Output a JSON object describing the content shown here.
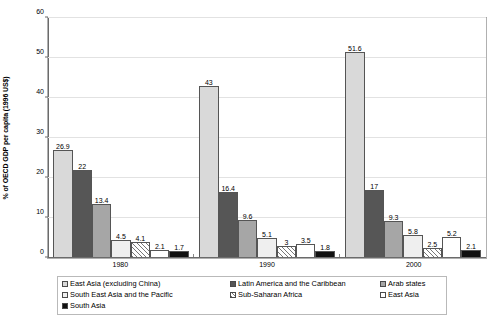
{
  "chart_data": {
    "type": "bar",
    "title": "",
    "xlabel": "",
    "ylabel": "% of OECD GDP per capita (1996 US$)",
    "categories": [
      "1980",
      "1990",
      "2000"
    ],
    "ylim": [
      0,
      60
    ],
    "yticks": [
      0,
      10,
      20,
      30,
      40,
      50,
      60
    ],
    "grid": true,
    "legend_position": "bottom",
    "series": [
      {
        "name": "East Asia (excluding China)",
        "values": [
          26.9,
          43,
          51.6
        ],
        "fill": "lightgray",
        "color": "#d9d9d9"
      },
      {
        "name": "Latin America and the Caribbean",
        "values": [
          22,
          16.4,
          17
        ],
        "fill": "darkgray",
        "color": "#565656"
      },
      {
        "name": "Arab states",
        "values": [
          13.4,
          9.6,
          9.3
        ],
        "fill": "midgray",
        "color": "#a6a6a6"
      },
      {
        "name": "South East Asia and the Pacific",
        "values": [
          4.5,
          5.1,
          5.8
        ],
        "fill": "palegray",
        "color": "#efefef"
      },
      {
        "name": "Sub-Saharan Africa",
        "values": [
          4.1,
          3,
          2.5
        ],
        "fill": "hatch",
        "color": "#ffffff"
      },
      {
        "name": "East Asia",
        "values": [
          2.1,
          3.5,
          5.2
        ],
        "fill": "white",
        "color": "#ffffff"
      },
      {
        "name": "South Asia",
        "values": [
          1.7,
          1.8,
          2.1
        ],
        "fill": "black",
        "color": "#111111"
      }
    ]
  },
  "axis": {
    "y_tick_labels": [
      "0",
      "10",
      "20",
      "30",
      "40",
      "50",
      "60"
    ],
    "x_tick_labels": [
      "1980",
      "1990",
      "2000"
    ],
    "y_axis_title": "% of OECD GDP per capita (1996 US$)"
  },
  "bar_labels": {
    "g0": [
      "26.9",
      "22",
      "13.4",
      "4.5",
      "4.1",
      "2.1",
      "1.7"
    ],
    "g1": [
      "43",
      "16.4",
      "9.6",
      "5.1",
      "3",
      "3.5",
      "1.8"
    ],
    "g2": [
      "51.6",
      "17",
      "9.3",
      "5.8",
      "2.5",
      "5.2",
      "2.1"
    ]
  },
  "legend": {
    "items": [
      {
        "label": "East Asia (excluding China)",
        "fill": "lightgray"
      },
      {
        "label": "Latin America and the Caribbean",
        "fill": "darkgray"
      },
      {
        "label": "Arab states",
        "fill": "midgray"
      },
      {
        "label": "South East Asia and the Pacific",
        "fill": "palegray"
      },
      {
        "label": "Sub-Saharan Africa",
        "fill": "hatch"
      },
      {
        "label": "East Asia",
        "fill": "white"
      },
      {
        "label": "South Asia",
        "fill": "black"
      }
    ]
  }
}
